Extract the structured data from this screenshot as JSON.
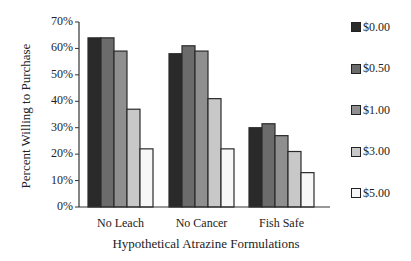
{
  "chart_data": {
    "type": "bar",
    "title": "",
    "xlabel": "Hypothetical Atrazine Formulations",
    "ylabel": "Percent Willing to Purchase",
    "categories": [
      "No Leach",
      "No Cancer",
      "Fish Safe"
    ],
    "series": [
      {
        "name": "$0.00",
        "color": "#2a2a2a",
        "values": [
          64,
          58,
          30
        ]
      },
      {
        "name": "$0.50",
        "color": "#6b6b6b",
        "values": [
          64,
          61,
          31.5
        ]
      },
      {
        "name": "$1.00",
        "color": "#8f8f8f",
        "values": [
          59,
          59,
          27
        ]
      },
      {
        "name": "$3.00",
        "color": "#c8c8c8",
        "values": [
          37,
          41,
          21
        ]
      },
      {
        "name": "$5.00",
        "color": "#f7f7f7",
        "values": [
          22,
          22,
          13
        ]
      }
    ],
    "ylim": [
      0,
      70
    ],
    "yticks": [
      "0%",
      "10%",
      "20%",
      "30%",
      "40%",
      "50%",
      "60%",
      "70%"
    ],
    "grid": false,
    "legend_position": "right"
  }
}
